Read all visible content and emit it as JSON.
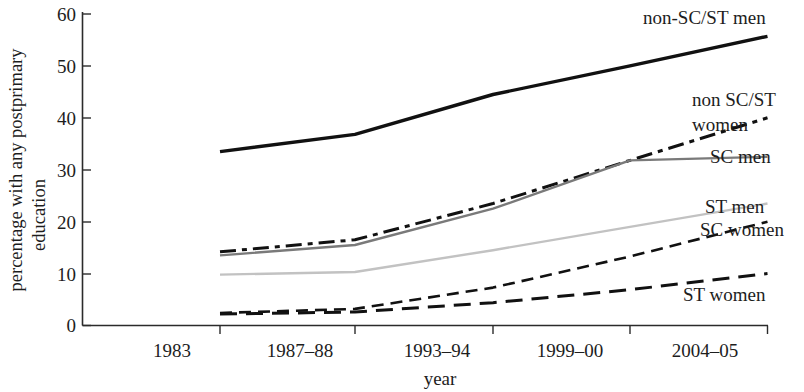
{
  "chart_data": {
    "type": "line",
    "title": "",
    "xlabel": "year",
    "ylabel": "percentage with any postprimary education",
    "categories": [
      "1983",
      "1987–88",
      "1993–94",
      "1999–00",
      "2004–05"
    ],
    "ylim": [
      0,
      60
    ],
    "yticks": [
      0,
      10,
      20,
      30,
      40,
      50,
      60
    ],
    "xlim_labels": [
      "1983",
      "2004–05"
    ],
    "grid": false,
    "legend": "right-inline-labels",
    "series": [
      {
        "name": "non-SC/ST men",
        "label": "non-SC/ST men",
        "values": [
          33.5,
          36.8,
          44.5,
          50.0,
          55.7
        ],
        "color": "#111111",
        "style": "solid",
        "width": 3.4
      },
      {
        "name": "non SC/ST women",
        "label": "non SC/ST\nwomen",
        "label_line1": "non SC/ST",
        "label_line2": "women",
        "values": [
          14.2,
          16.5,
          23.5,
          31.8,
          40.0
        ],
        "color": "#111111",
        "style": "dash-dot",
        "width": 3.0
      },
      {
        "name": "SC men",
        "label": "SC men",
        "values": [
          13.5,
          15.5,
          22.5,
          31.8,
          32.5
        ],
        "color": "#7a7a7a",
        "style": "solid",
        "width": 2.4
      },
      {
        "name": "ST men",
        "label": "ST men",
        "values": [
          9.8,
          10.3,
          14.5,
          19.0,
          23.5
        ],
        "color": "#c2c2c2",
        "style": "solid",
        "width": 2.4
      },
      {
        "name": "SC women",
        "label": "SC women",
        "values": [
          2.4,
          3.2,
          7.3,
          13.3,
          20.0
        ],
        "color": "#111111",
        "style": "dashed-fine",
        "width": 2.6
      },
      {
        "name": "ST women",
        "label": "ST women",
        "values": [
          2.2,
          2.6,
          4.4,
          6.9,
          10.0
        ],
        "color": "#111111",
        "style": "dashed-coarse",
        "width": 3.0
      }
    ]
  },
  "axes": {
    "y_tick_labels": [
      "60",
      "50",
      "40",
      "30",
      "20",
      "10",
      "0"
    ],
    "x_tick_labels": [
      "1983",
      "1987–88",
      "1993–94",
      "1999–00",
      "2004–05"
    ],
    "x_axis_title": "year",
    "y_axis_title_line1": "percentage with any postprimary",
    "y_axis_title_line2": "education"
  },
  "series_labels": {
    "non_sc_st_men": "non-SC/ST men",
    "non_sc_st_women_l1": "non SC/ST",
    "non_sc_st_women_l2": "women",
    "sc_men": "SC men",
    "st_men": "ST men",
    "sc_women": "SC women",
    "st_women": "ST women"
  }
}
